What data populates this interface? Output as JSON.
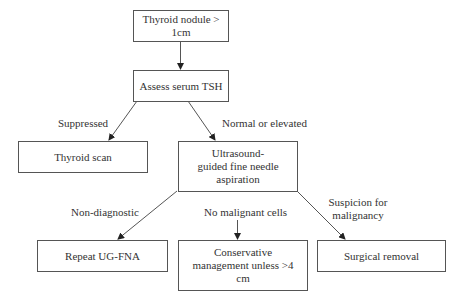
{
  "nodes": {
    "start": "Thyroid nodule > 1cm",
    "tsh": "Assess serum TSH",
    "scan": "Thyroid scan",
    "fna": "Ultrasound-guided fine needle aspiration",
    "repeat": "Repeat UG-FNA",
    "conservative": "Conservative management unless >4 cm",
    "surgery": "Surgical removal"
  },
  "edges": {
    "suppressed": "Suppressed",
    "normal": "Normal or elevated",
    "nondiag": "Non-diagnostic",
    "nomalig": "No malignant cells",
    "suspicion": "Suspicion for malignancy"
  }
}
